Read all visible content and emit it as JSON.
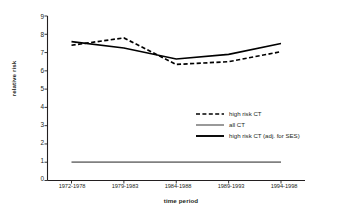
{
  "chart_data": {
    "type": "line",
    "title": "",
    "xlabel": "time period",
    "ylabel": "relative risk",
    "categories": [
      "1972-1978",
      "1979-1983",
      "1984-1988",
      "1989-1993",
      "1994-1998"
    ],
    "ylim": [
      0,
      9
    ],
    "yticks": [
      "0",
      "1",
      "2",
      "3",
      "4",
      "5",
      "6",
      "7",
      "8",
      "9"
    ],
    "grid": false,
    "legend_position": "inside-center-right",
    "series": [
      {
        "name": "high risk CT",
        "style": "dashed",
        "color": "#000000",
        "values": [
          7.4,
          7.8,
          6.35,
          6.5,
          7.05
        ]
      },
      {
        "name": "all CT",
        "style": "solid",
        "color": "#808080",
        "values": [
          1.0,
          1.0,
          1.0,
          1.0,
          1.0
        ]
      },
      {
        "name": "high risk CT (adj. for SES)",
        "style": "solid",
        "color": "#000000",
        "values": [
          7.6,
          7.25,
          6.65,
          6.9,
          7.5
        ]
      }
    ]
  },
  "axis": {
    "y_title": "relative risk",
    "x_title": "time period",
    "y_tick_0": "0",
    "y_tick_1": "1",
    "y_tick_2": "2",
    "y_tick_3": "3",
    "y_tick_4": "4",
    "y_tick_5": "5",
    "y_tick_6": "6",
    "y_tick_7": "7",
    "y_tick_8": "8",
    "y_tick_9": "9",
    "x_tick_0": "1972-1978",
    "x_tick_1": "1979-1983",
    "x_tick_2": "1984-1988",
    "x_tick_3": "1989-1993",
    "x_tick_4": "1994-1998"
  },
  "legend": {
    "items": [
      {
        "label": "high risk CT"
      },
      {
        "label": "all CT"
      },
      {
        "label": "high risk CT (adj. for SES)"
      }
    ]
  },
  "colors": {
    "background": "#ffffff",
    "axis": "#231f20",
    "series_black": "#000000",
    "series_gray": "#808080"
  }
}
